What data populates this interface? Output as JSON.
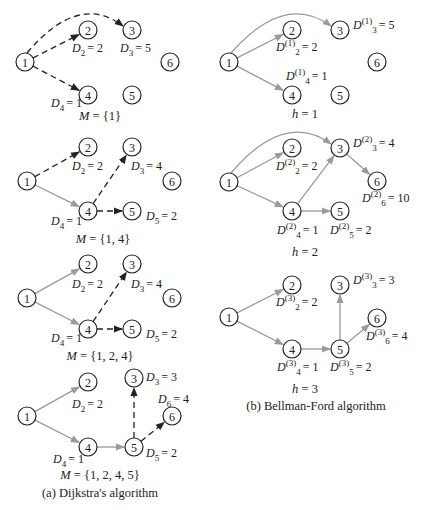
{
  "figure": {
    "panel_a": {
      "caption": "(a) Dijkstra's algorithm",
      "steps": [
        {
          "set_label": "M = {1}",
          "nodes": {
            "1": [
              25,
              62
            ],
            "2": [
              88,
              30
            ],
            "3": [
              132,
              30
            ],
            "4": [
              88,
              95
            ],
            "5": [
              132,
              95
            ],
            "6": [
              170,
              62
            ]
          },
          "edges": [
            {
              "from": "1",
              "to": "2",
              "style": "dashed"
            },
            {
              "from": "1",
              "to": "3",
              "style": "dashed",
              "curve": true
            },
            {
              "from": "1",
              "to": "4",
              "style": "dashed"
            }
          ],
          "labels": [
            {
              "text": "D",
              "sub": "2",
              "sup": "",
              "value": "= 2",
              "x": 72,
              "y": 52
            },
            {
              "text": "D",
              "sub": "3",
              "sup": "",
              "value": "= 5",
              "x": 120,
              "y": 52
            },
            {
              "text": "D",
              "sub": "4",
              "sup": "",
              "value": "= 1",
              "x": 51,
              "y": 107
            }
          ],
          "set_pos": [
            100,
            120
          ]
        },
        {
          "set_label": "M = {1, 4}",
          "nodes": {
            "1": [
              27,
              181
            ],
            "2": [
              88,
              147
            ],
            "3": [
              132,
              147
            ],
            "4": [
              88,
              211
            ],
            "5": [
              132,
              211
            ],
            "6": [
              172,
              181
            ]
          },
          "edges": [
            {
              "from": "1",
              "to": "2",
              "style": "dashed"
            },
            {
              "from": "1",
              "to": "4",
              "style": "solid"
            },
            {
              "from": "4",
              "to": "3",
              "style": "dashed"
            },
            {
              "from": "4",
              "to": "5",
              "style": "dashed"
            }
          ],
          "labels": [
            {
              "text": "D",
              "sub": "2",
              "sup": "",
              "value": "= 2",
              "x": 72,
              "y": 170
            },
            {
              "text": "D",
              "sub": "3",
              "sup": "",
              "value": "= 4",
              "x": 131,
              "y": 170
            },
            {
              "text": "D",
              "sub": "4",
              "sup": "",
              "value": "= 1",
              "x": 51,
              "y": 225
            },
            {
              "text": "D",
              "sub": "5",
              "sup": "",
              "value": "= 2",
              "x": 146,
              "y": 220
            }
          ],
          "set_pos": [
            103,
            243
          ]
        },
        {
          "set_label": "M = {1, 2, 4}",
          "nodes": {
            "1": [
              27,
              298
            ],
            "2": [
              88,
              264
            ],
            "3": [
              132,
              264
            ],
            "4": [
              88,
              329
            ],
            "5": [
              132,
              329
            ],
            "6": [
              172,
              298
            ]
          },
          "edges": [
            {
              "from": "1",
              "to": "2",
              "style": "solid"
            },
            {
              "from": "1",
              "to": "4",
              "style": "solid"
            },
            {
              "from": "4",
              "to": "3",
              "style": "dashed"
            },
            {
              "from": "4",
              "to": "5",
              "style": "dashed"
            }
          ],
          "labels": [
            {
              "text": "D",
              "sub": "2",
              "sup": "",
              "value": "= 2",
              "x": 72,
              "y": 288
            },
            {
              "text": "D",
              "sub": "3",
              "sup": "",
              "value": "= 4",
              "x": 131,
              "y": 288
            },
            {
              "text": "D",
              "sub": "4",
              "sup": "",
              "value": "= 1",
              "x": 51,
              "y": 342
            },
            {
              "text": "D",
              "sub": "5",
              "sup": "",
              "value": "= 2",
              "x": 146,
              "y": 338
            }
          ],
          "set_pos": [
            100,
            360
          ]
        },
        {
          "set_label": "M = {1, 2, 4, 5}",
          "nodes": {
            "1": [
              27,
              416
            ],
            "2": [
              88,
              382
            ],
            "3": [
              134,
              378
            ],
            "4": [
              88,
              447
            ],
            "5": [
              134,
              447
            ],
            "6": [
              172,
              416
            ]
          },
          "edges": [
            {
              "from": "1",
              "to": "2",
              "style": "solid"
            },
            {
              "from": "1",
              "to": "4",
              "style": "solid"
            },
            {
              "from": "4",
              "to": "5",
              "style": "solid"
            },
            {
              "from": "5",
              "to": "3",
              "style": "dashed"
            },
            {
              "from": "5",
              "to": "6",
              "style": "dashed"
            }
          ],
          "labels": [
            {
              "text": "D",
              "sub": "2",
              "sup": "",
              "value": "= 2",
              "x": 72,
              "y": 408
            },
            {
              "text": "D",
              "sub": "3",
              "sup": "",
              "value": "= 3",
              "x": 146,
              "y": 381
            },
            {
              "text": "D",
              "sub": "6",
              "sup": "",
              "value": "= 4",
              "x": 158,
              "y": 403
            },
            {
              "text": "D",
              "sub": "4",
              "sup": "",
              "value": "= 1",
              "x": 53,
              "y": 463
            },
            {
              "text": "D",
              "sub": "5",
              "sup": "",
              "value": "= 2",
              "x": 146,
              "y": 457
            }
          ],
          "set_pos": [
            100,
            479
          ]
        }
      ],
      "caption_pos": [
        100,
        497
      ]
    },
    "panel_b": {
      "caption": "(b) Bellman-Ford algorithm",
      "steps": [
        {
          "set_label": "h = 1",
          "nodes": {
            "1": [
              229,
              62
            ],
            "2": [
              292,
              30
            ],
            "3": [
              340,
              30
            ],
            "4": [
              292,
              95
            ],
            "5": [
              340,
              95
            ],
            "6": [
              377,
              62
            ]
          },
          "edges": [
            {
              "from": "1",
              "to": "2",
              "style": "solid"
            },
            {
              "from": "1",
              "to": "3",
              "style": "solid",
              "curve": true
            },
            {
              "from": "1",
              "to": "4",
              "style": "solid"
            }
          ],
          "labels": [
            {
              "text": "D",
              "sub": "3",
              "sup": "(1)",
              "value": "= 5",
              "x": 353,
              "y": 29
            },
            {
              "text": "D",
              "sub": "2",
              "sup": "(1)",
              "value": "= 2",
              "x": 276,
              "y": 51
            },
            {
              "text": "D",
              "sub": "4",
              "sup": "(1)",
              "value": "= 1",
              "x": 286,
              "y": 80
            }
          ],
          "set_pos": [
            305,
            118
          ]
        },
        {
          "set_label": "h = 2",
          "nodes": {
            "1": [
              229,
              182
            ],
            "2": [
              292,
              148
            ],
            "3": [
              340,
              148
            ],
            "4": [
              292,
              211
            ],
            "5": [
              340,
              211
            ],
            "6": [
              377,
              181
            ]
          },
          "edges": [
            {
              "from": "1",
              "to": "2",
              "style": "solid"
            },
            {
              "from": "1",
              "to": "3",
              "style": "solid",
              "curve": true
            },
            {
              "from": "1",
              "to": "4",
              "style": "solid"
            },
            {
              "from": "4",
              "to": "3",
              "style": "solid"
            },
            {
              "from": "4",
              "to": "5",
              "style": "solid"
            },
            {
              "from": "3",
              "to": "6",
              "style": "solid"
            }
          ],
          "labels": [
            {
              "text": "D",
              "sub": "3",
              "sup": "(2)",
              "value": "= 4",
              "x": 353,
              "y": 147
            },
            {
              "text": "D",
              "sub": "2",
              "sup": "(2)",
              "value": "= 2",
              "x": 276,
              "y": 170
            },
            {
              "text": "D",
              "sub": "6",
              "sup": "(2)",
              "value": "= 10",
              "x": 362,
              "y": 202
            },
            {
              "text": "D",
              "sub": "4",
              "sup": "(2)",
              "value": "= 1",
              "x": 277,
              "y": 234
            },
            {
              "text": "D",
              "sub": "5",
              "sup": "(2)",
              "value": "= 2",
              "x": 330,
              "y": 234
            }
          ],
          "set_pos": [
            305,
            256
          ]
        },
        {
          "set_label": "h = 3",
          "nodes": {
            "1": [
              229,
              317
            ],
            "2": [
              292,
              285
            ],
            "3": [
              340,
              285
            ],
            "4": [
              292,
              349
            ],
            "5": [
              340,
              349
            ],
            "6": [
              377,
              318
            ]
          },
          "edges": [
            {
              "from": "1",
              "to": "2",
              "style": "solid"
            },
            {
              "from": "1",
              "to": "4",
              "style": "solid"
            },
            {
              "from": "4",
              "to": "5",
              "style": "solid"
            },
            {
              "from": "5",
              "to": "3",
              "style": "solid"
            },
            {
              "from": "5",
              "to": "6",
              "style": "solid"
            }
          ],
          "labels": [
            {
              "text": "D",
              "sub": "3",
              "sup": "(3)",
              "value": "= 3",
              "x": 353,
              "y": 284
            },
            {
              "text": "D",
              "sub": "2",
              "sup": "(3)",
              "value": "= 2",
              "x": 276,
              "y": 306
            },
            {
              "text": "D",
              "sub": "6",
              "sup": "(3)",
              "value": "= 4",
              "x": 366,
              "y": 340
            },
            {
              "text": "D",
              "sub": "4",
              "sup": "(3)",
              "value": "= 1",
              "x": 277,
              "y": 371
            },
            {
              "text": "D",
              "sub": "5",
              "sup": "(3)",
              "value": "= 2",
              "x": 330,
              "y": 371
            }
          ],
          "set_pos": [
            305,
            393
          ]
        }
      ],
      "caption_pos": [
        316,
        410
      ]
    },
    "colors": {
      "solid_edge": "#9a9a9a",
      "dashed_edge": "#222222",
      "node_stroke": "#222222"
    }
  }
}
